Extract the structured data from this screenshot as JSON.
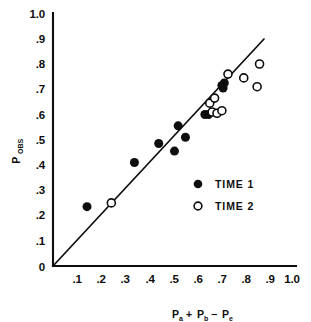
{
  "chart_data": {
    "type": "scatter",
    "title": "",
    "xlabel": "Pₐ + Pᵇ − Pₑ",
    "ylabel": "Pₒʙs",
    "xlabel_parts": {
      "term1_base": "P",
      "term1_sub": "a",
      "op1": "+",
      "term2_base": "P",
      "term2_sub": "b",
      "op2": "−",
      "term3_base": "P",
      "term3_sub": "e"
    },
    "ylabel_parts": {
      "base": "P",
      "sub": "OBS"
    },
    "xlim": [
      0.0,
      1.0
    ],
    "ylim": [
      0.0,
      1.0
    ],
    "grid": false,
    "xticks": [
      0.1,
      0.2,
      0.3,
      0.4,
      0.5,
      0.6,
      0.7,
      0.8,
      0.9,
      1.0
    ],
    "xtick_labels": [
      ".1",
      ".2",
      ".3",
      ".4",
      ".5",
      ".6",
      ".7",
      ".8",
      ".9",
      "1.0"
    ],
    "yticks": [
      0.1,
      0.2,
      0.3,
      0.4,
      0.5,
      0.6,
      0.7,
      0.8,
      0.9,
      1.0
    ],
    "ytick_labels": [
      ".1",
      ".2",
      ".3",
      ".4",
      ".5",
      ".6",
      ".7",
      ".8",
      ".9",
      "1.0"
    ],
    "origin_label": "0",
    "legend_position": "center-right-inside",
    "reference_line": {
      "type": "identity",
      "label": "y = x",
      "from": [
        0.0,
        0.0
      ],
      "to": [
        0.88,
        0.9
      ]
    },
    "series": [
      {
        "name": "TIME 1",
        "marker": "filled-circle",
        "color": "#0d0d0d",
        "points": [
          [
            0.14,
            0.235
          ],
          [
            0.335,
            0.41
          ],
          [
            0.435,
            0.485
          ],
          [
            0.5,
            0.455
          ],
          [
            0.515,
            0.555
          ],
          [
            0.545,
            0.51
          ],
          [
            0.625,
            0.6
          ],
          [
            0.64,
            0.6
          ],
          [
            0.695,
            0.715
          ],
          [
            0.7,
            0.705
          ],
          [
            0.705,
            0.725
          ]
        ]
      },
      {
        "name": "TIME 2",
        "marker": "open-circle",
        "color": "#0d0d0d",
        "points": [
          [
            0.24,
            0.25
          ],
          [
            0.645,
            0.645
          ],
          [
            0.655,
            0.61
          ],
          [
            0.665,
            0.665
          ],
          [
            0.675,
            0.605
          ],
          [
            0.695,
            0.615
          ],
          [
            0.72,
            0.76
          ],
          [
            0.785,
            0.745
          ],
          [
            0.84,
            0.71
          ],
          [
            0.85,
            0.8
          ]
        ]
      }
    ]
  },
  "legend": {
    "entries": [
      {
        "label": "TIME 1",
        "marker": "filled-circle"
      },
      {
        "label": "TIME 2",
        "marker": "open-circle"
      }
    ]
  }
}
